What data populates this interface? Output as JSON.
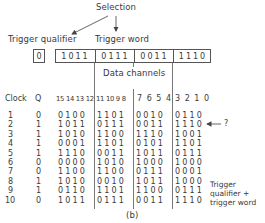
{
  "diagram": {
    "selection_label": "Selection",
    "trigger_qualifier_label": "Trigger qualifier",
    "trigger_word_label": "Trigger word",
    "trigger_qualifier_value": "0",
    "trigger_word_nibbles": [
      "1011",
      "0111",
      "0011",
      "1110"
    ],
    "data_channels_label": "Data channels",
    "figure_label": "(b)",
    "question_mark": "?",
    "annotation_lines": [
      "Trigger",
      "qualifier +",
      "trigger word"
    ]
  },
  "table": {
    "headers": {
      "clock": "Clock",
      "q": "Q",
      "group1": "15 14 13 12",
      "group2": "11 10 9 8",
      "group3": "7 6 5 4",
      "group4": "3 2 1 0"
    },
    "rows": [
      {
        "clock": "1",
        "q": "0",
        "g1": "0100",
        "g2": "1101",
        "g3": "0010",
        "g4": "0110"
      },
      {
        "clock": "2",
        "q": "1",
        "g1": "1011",
        "g2": "0111",
        "g3": "0011",
        "g4": "1110"
      },
      {
        "clock": "3",
        "q": "1",
        "g1": "1010",
        "g2": "1100",
        "g3": "1110",
        "g4": "1001"
      },
      {
        "clock": "4",
        "q": "1",
        "g1": "0001",
        "g2": "1101",
        "g3": "0101",
        "g4": "1101"
      },
      {
        "clock": "5",
        "q": "1",
        "g1": "1110",
        "g2": "0011",
        "g3": "1011",
        "g4": "0111"
      },
      {
        "clock": "6",
        "q": "0",
        "g1": "0000",
        "g2": "1010",
        "g3": "1000",
        "g4": "1000"
      },
      {
        "clock": "7",
        "q": "0",
        "g1": "1100",
        "g2": "1100",
        "g3": "0111",
        "g4": "0001"
      },
      {
        "clock": "8",
        "q": "1",
        "g1": "1010",
        "g2": "0010",
        "g3": "1011",
        "g4": "1000"
      },
      {
        "clock": "9",
        "q": "1",
        "g1": "0110",
        "g2": "1101",
        "g3": "1100",
        "g4": "0111"
      },
      {
        "clock": "10",
        "q": "0",
        "g1": "1011",
        "g2": "0111",
        "g3": "0011",
        "g4": "1110"
      }
    ]
  }
}
